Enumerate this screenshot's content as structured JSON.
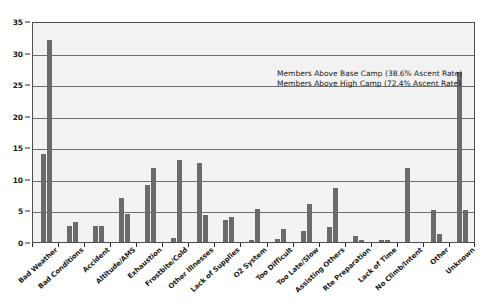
{
  "chart_data": {
    "type": "bar",
    "title": "",
    "subtitle": "",
    "xlabel": "",
    "ylabel": "",
    "ylim": [
      0,
      35
    ],
    "ytick_labels": [
      "0",
      "5",
      "10",
      "15",
      "20",
      "25",
      "30",
      "35"
    ],
    "ytick_values": [
      0,
      5,
      10,
      15,
      20,
      25,
      30,
      35
    ],
    "grid": true,
    "legend_position": "none",
    "categories": [
      "Bad Weather",
      "Bad Conditions",
      "Accident",
      "Altitude/AMS",
      "Exhaustion",
      "Frostbite/Cold",
      "Other Illnesses",
      "Lack of Supplies",
      "O2 System",
      "Too Difficult",
      "Too Late/Slow",
      "Assisting Others",
      "Rte Preparation",
      "Lack of Time",
      "No Climb/Intent",
      "Other",
      "Unknown"
    ],
    "series": [
      {
        "name": "Members Above Base Camp (38.6% Ascent Rate)",
        "color": "#6a6a6a",
        "values": [
          14.0,
          2.5,
          2.5,
          7.0,
          9.0,
          0.7,
          12.5,
          3.5,
          0.3,
          0.5,
          1.7,
          2.3,
          1.0,
          0.3,
          11.7,
          5.0,
          27.0
        ]
      },
      {
        "name": "Members Above High Camp (72.4% Ascent Rate)",
        "color": "#6a6a6a",
        "values": [
          32.0,
          3.2,
          2.5,
          4.5,
          11.7,
          13.0,
          4.2,
          4.0,
          5.3,
          2.0,
          6.0,
          8.5,
          0.3,
          0.3,
          0.0,
          1.3,
          5.0
        ]
      }
    ],
    "annotations": [
      "Members Above Base Camp (38.6% Ascent Rate)",
      "Members Above High Camp (72.4% Ascent Rate)"
    ]
  }
}
